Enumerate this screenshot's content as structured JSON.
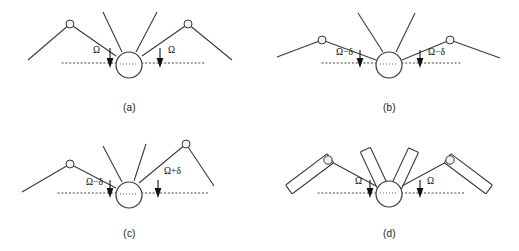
{
  "figure": {
    "name": "four-panel-hub-spoke-angle-diagram",
    "background_color": "#ffffff",
    "line_color": "#3a3a3a",
    "text_color": "#111111",
    "dotted_line_color": "#444444"
  },
  "symbols": {
    "omega": "Ω",
    "delta": "δ",
    "minus": "−",
    "plus": "+"
  },
  "panels": [
    {
      "id": "a",
      "caption": "(a)",
      "description": "symmetric configuration, both arms at angle Omega",
      "left_label": "Ω",
      "right_label": "Ω",
      "left_angle_deg": 30,
      "right_angle_deg": 30,
      "arms_style": "line",
      "hub_radius": 13,
      "joint_radius": 4
    },
    {
      "id": "b",
      "caption": "(b)",
      "description": "symmetric shallow configuration, both arms at Omega minus delta",
      "left_label": "Ω−δ",
      "right_label": "Ω−δ",
      "left_angle_deg": 16,
      "right_angle_deg": 16,
      "arms_style": "line",
      "hub_radius": 13,
      "joint_radius": 4
    },
    {
      "id": "c",
      "caption": "(c)",
      "description": "asymmetric configuration, left arm Omega minus delta, right arm Omega plus delta",
      "left_label": "Ω−δ",
      "right_label": "Ω+δ",
      "left_angle_deg": 18,
      "right_angle_deg": 42,
      "arms_style": "line",
      "hub_radius": 13,
      "joint_radius": 4
    },
    {
      "id": "d",
      "caption": "(d)",
      "description": "symmetric configuration with rigid bar links, both arms at angle Omega",
      "left_label": "Ω",
      "right_label": "Ω",
      "left_angle_deg": 30,
      "right_angle_deg": 30,
      "arms_style": "bar",
      "hub_radius": 13,
      "joint_radius": 4
    }
  ]
}
